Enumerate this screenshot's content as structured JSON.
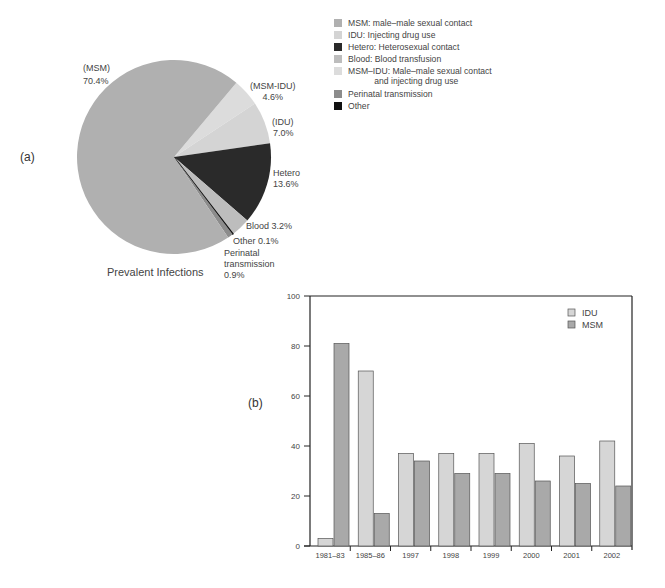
{
  "chart_data": [
    {
      "type": "pie",
      "panel": "(a)",
      "title": "Prevalent Infections",
      "start_angle_deg": 40,
      "direction": "clockwise",
      "slices": [
        {
          "key": "MSM-IDU",
          "label_line1": "(MSM-IDU)",
          "label_line2": "4.6%",
          "value": 4.6,
          "color": "#dcdcdc"
        },
        {
          "key": "IDU",
          "label_line1": "(IDU)",
          "label_line2": "7.0%",
          "value": 7.0,
          "color": "#d4d4d4"
        },
        {
          "key": "Hetero",
          "label_line1": "Hetero",
          "label_line2": "13.6%",
          "value": 13.6,
          "color": "#2a2a2a"
        },
        {
          "key": "Blood",
          "label_line1": "Blood 3.2%",
          "label_line2": "",
          "value": 3.2,
          "color": "#bdbdbd"
        },
        {
          "key": "Other",
          "label_line1": "Other 0.1%",
          "label_line2": "",
          "value": 0.1,
          "color": "#111111"
        },
        {
          "key": "Perinatal",
          "label_line1": "Perinatal",
          "label_line2": "transmission",
          "label_line3": "0.9%",
          "value": 0.9,
          "color": "#8c8c8c"
        },
        {
          "key": "MSM",
          "label_line1": "(MSM)",
          "label_line2": "70.4%",
          "value": 70.4,
          "color": "#b0b0b0"
        }
      ],
      "legend": [
        {
          "text": "MSM: male–male sexual contact",
          "color": "#b0b0b0"
        },
        {
          "text": "IDU: Injecting drug use",
          "color": "#d4d4d4"
        },
        {
          "text": "Hetero: Heterosexual contact",
          "color": "#2a2a2a"
        },
        {
          "text": "Blood: Blood transfusion",
          "color": "#bdbdbd"
        },
        {
          "text": "MSM–IDU: Male–male sexual contact\n           and injecting drug use",
          "color": "#dcdcdc"
        },
        {
          "text": "Perinatal transmission",
          "color": "#8c8c8c"
        },
        {
          "text": "Other",
          "color": "#111111"
        }
      ]
    },
    {
      "type": "bar",
      "panel": "(b)",
      "title": "",
      "xlabel": "",
      "ylabel": "",
      "ylim": [
        0,
        100
      ],
      "yticks": [
        0,
        20,
        40,
        60,
        80,
        100
      ],
      "grid": false,
      "legend_position": "top-right",
      "categories": [
        "1981–83",
        "1985–86",
        "1997",
        "1998",
        "1999",
        "2000",
        "2001",
        "2002"
      ],
      "series": [
        {
          "name": "IDU",
          "color": "#d6d6d6",
          "values": [
            3,
            70,
            37,
            37,
            37,
            41,
            36,
            42
          ]
        },
        {
          "name": "MSM",
          "color": "#a9a9a9",
          "values": [
            81,
            13,
            34,
            29,
            29,
            26,
            25,
            24
          ]
        }
      ]
    }
  ],
  "labels": {
    "panel_a": "(a)",
    "panel_b": "(b)",
    "pie_title": "Prevalent Infections",
    "msm_l1": "(MSM)",
    "msm_l2": "70.4%",
    "msmidu_l1": "(MSM-IDU)",
    "msmidu_l2": "4.6%",
    "idu_l1": "(IDU)",
    "idu_l2": "7.0%",
    "hetero_l1": "Hetero",
    "hetero_l2": "13.6%",
    "blood": "Blood 3.2%",
    "other": "Other 0.1%",
    "perinatal_l1": "Perinatal",
    "perinatal_l2": "transmission",
    "perinatal_l3": "0.9%",
    "bar_legend_idu": "IDU",
    "bar_legend_msm": "MSM"
  }
}
